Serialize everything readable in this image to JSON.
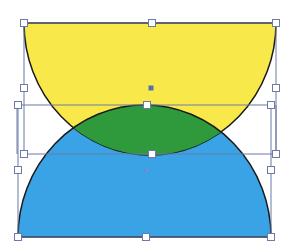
{
  "diagram": {
    "shapes": [
      {
        "id": "yellow-semicircle",
        "kind": "semicircle-down",
        "fill": "#f9e84a",
        "stroke": "#1a1a1a"
      },
      {
        "id": "blue-semicircle",
        "kind": "semicircle-up",
        "fill": "#3aa3e6",
        "stroke": "#1a1a1a"
      },
      {
        "id": "green-intersection",
        "kind": "lens",
        "fill": "#2f9a3c",
        "stroke": "#1a1a1a"
      }
    ],
    "selection": {
      "frame_color": "#6b7aa8",
      "handle_fill": "#ffffff",
      "handle_stroke": "#6b7aa8",
      "center_marker_color": "#5a6fb0",
      "pivot_marker_color": "#b07a9a"
    }
  }
}
